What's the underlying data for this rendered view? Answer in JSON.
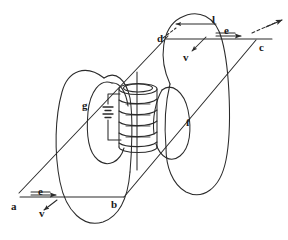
{
  "figure": {
    "stroke_color": "#2b2b2b",
    "background_color": "#ffffff",
    "labels": [
      {
        "id": "a",
        "text": "a",
        "x": 11,
        "y": 201,
        "desc": "lower-left vertex of loop"
      },
      {
        "id": "b",
        "text": "b",
        "x": 111,
        "y": 199,
        "desc": "lower-right vertex of loop"
      },
      {
        "id": "c",
        "text": "c",
        "x": 259,
        "y": 42,
        "desc": "upper-right vertex of loop"
      },
      {
        "id": "d",
        "text": "d",
        "x": 157,
        "y": 33,
        "desc": "upper-left vertex of loop"
      },
      {
        "id": "e1",
        "text": "e",
        "x": 38,
        "y": 186,
        "desc": "E-field label, bottom segment"
      },
      {
        "id": "e2",
        "text": "e",
        "x": 224,
        "y": 28,
        "desc": "E-field label, top segment"
      },
      {
        "id": "v1",
        "text": "v",
        "x": 39,
        "y": 210,
        "desc": "velocity label, bottom"
      },
      {
        "id": "v2",
        "text": "v",
        "x": 183,
        "y": 53,
        "desc": "velocity label, top"
      },
      {
        "id": "l",
        "text": "l",
        "x": 212,
        "y": 17,
        "desc": "length vector label"
      },
      {
        "id": "f",
        "text": "f",
        "x": 186,
        "y": 118,
        "desc": "field line label right"
      },
      {
        "id": "g",
        "text": "g",
        "x": 82,
        "y": 101,
        "desc": "field line label left"
      }
    ],
    "elements": {
      "solenoid": {
        "name": "solenoid-coil",
        "turns": 5,
        "center_x": 137,
        "top_y": 88,
        "bottom_y": 148
      },
      "battery": {
        "name": "battery-cell",
        "plates": 2
      },
      "field_lines": {
        "left_outer": "ellipse",
        "left_inner": "ellipse",
        "right_outer": "ellipse",
        "right_inner": "ellipse"
      },
      "loop": {
        "name": "conductor-loop-abcd",
        "vertices": [
          "a",
          "b",
          "c",
          "d"
        ]
      },
      "arrows": [
        {
          "name": "e-arrow-bottom",
          "direction": "right"
        },
        {
          "name": "v-arrow-bottom",
          "direction": "down-left"
        },
        {
          "name": "e-arrow-top",
          "direction": "right"
        },
        {
          "name": "v-arrow-top",
          "direction": "down-left"
        },
        {
          "name": "l-arrow",
          "direction": "left"
        },
        {
          "name": "diagonal-arrow-top-right",
          "direction": "up-right"
        }
      ]
    }
  }
}
